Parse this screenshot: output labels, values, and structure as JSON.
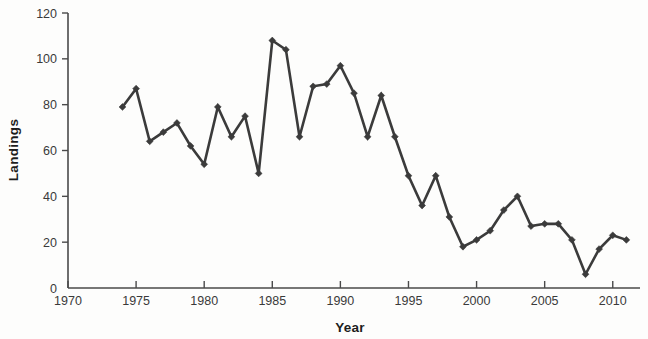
{
  "chart_data": {
    "type": "line",
    "title": "",
    "xlabel": "Year",
    "ylabel": "Landings",
    "xlim": [
      1970,
      2012
    ],
    "ylim": [
      0,
      120
    ],
    "grid": false,
    "legend": false,
    "legend_position": "none",
    "xticks": [
      1970,
      1975,
      1980,
      1985,
      1990,
      1995,
      2000,
      2005,
      2010
    ],
    "xtick_labels": [
      "1970",
      "1975",
      "1980",
      "1985",
      "1990",
      "1995",
      "2000",
      "2005",
      "2010"
    ],
    "yticks": [
      0,
      20,
      40,
      60,
      80,
      100,
      120
    ],
    "ytick_labels": [
      "0",
      "20",
      "40",
      "60",
      "80",
      "100",
      "120"
    ],
    "marker": "diamond",
    "line_color": "#3b3b3b",
    "x": [
      1974,
      1975,
      1976,
      1977,
      1978,
      1979,
      1980,
      1981,
      1982,
      1983,
      1984,
      1985,
      1986,
      1987,
      1988,
      1989,
      1990,
      1991,
      1992,
      1993,
      1994,
      1995,
      1996,
      1997,
      1998,
      1999,
      2000,
      2001,
      2002,
      2003,
      2004,
      2005,
      2006,
      2007,
      2008,
      2009,
      2010,
      2011
    ],
    "values": [
      79,
      87,
      64,
      68,
      72,
      62,
      54,
      79,
      66,
      75,
      50,
      108,
      104,
      66,
      88,
      89,
      97,
      85,
      66,
      84,
      66,
      49,
      36,
      49,
      31,
      18,
      21,
      25,
      34,
      40,
      27,
      28,
      28,
      21,
      6,
      17,
      23,
      21
    ],
    "series": [
      {
        "name": "Landings",
        "values": [
          79,
          87,
          64,
          68,
          72,
          62,
          54,
          79,
          66,
          75,
          50,
          108,
          104,
          66,
          88,
          89,
          97,
          85,
          66,
          84,
          66,
          49,
          36,
          49,
          31,
          18,
          21,
          25,
          34,
          40,
          27,
          28,
          28,
          21,
          6,
          17,
          23,
          21
        ]
      }
    ],
    "annotations": []
  }
}
